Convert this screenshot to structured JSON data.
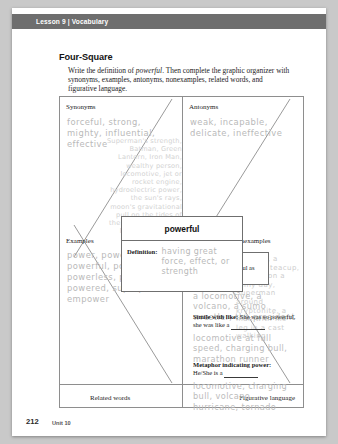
{
  "running_head": "Lesson 9 | Vocabulary",
  "worksheet": {
    "title": "Four-Square",
    "directions_pre": "Write the definition of ",
    "directions_word": "powerful",
    "directions_post": ". Then complete the graphic organizer with synonyms, examples, antonyms, nonexamples, related words, and figurative language."
  },
  "organizer": {
    "labels": {
      "synonyms": "Synonyms",
      "antonyms": "Antonyms",
      "examples": "Examples",
      "nonexamples": "Nonexamples",
      "related_words": "Related words",
      "figurative_language": "Figurative language"
    },
    "answers": {
      "synonyms": "forceful, strong, mighty, influential, effective",
      "antonyms": "weak, incapable, delicate, ineffective",
      "examples": "power, powers, powerful, powerfully, powerless, powering, powered, superpower, empower",
      "related_words": "Superman's strength, Batman, Green Lantern, Iron Man, wealthy person, locomotive, jet or rocket engine, hydroelectric power, the sun's rays, moon's gravitational pull on the tides of the Earth, a person's love for his or her child",
      "nonexamples": "a flower, a delicate teacup, the sun on a rainy day, Superman around kryptonite, a man with his leg in a cast walking"
    },
    "center": {
      "word": "powerful",
      "definition_label": "Definition:",
      "definition_answer": "having great force, effect, or strength"
    },
    "figurative": {
      "simile_as_label": "Simile with as:",
      "simile_as_prompt": "He was as powerful as",
      "simile_as_answer": "a locomotive, a volcano, a sumo wrestler, the president",
      "simile_like_label": "Simile with like:",
      "simile_like_prompt": "She was so powerful, she was like a",
      "simile_like_answer": "locomotive at full speed, charging bull, marathon runner",
      "metaphor_label": "Metaphor indicating power:",
      "metaphor_prompt": "He/She is a",
      "metaphor_answer": "locomotive, charging bull, volcano, hurricane, tornado"
    }
  },
  "footer": {
    "page_number": "212",
    "unit": "Unit 10"
  }
}
